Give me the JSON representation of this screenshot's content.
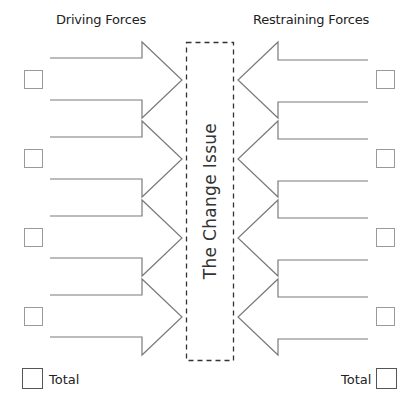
{
  "diagram": {
    "type": "force-field-analysis",
    "driving_title": "Driving Forces",
    "restraining_title": "Restraining Forces",
    "center_label": "The Change Issue",
    "total_label_left": "Total",
    "total_label_right": "Total",
    "driving_forces": [
      {
        "score": ""
      },
      {
        "score": ""
      },
      {
        "score": ""
      },
      {
        "score": ""
      }
    ],
    "restraining_forces": [
      {
        "score": ""
      },
      {
        "score": ""
      },
      {
        "score": ""
      },
      {
        "score": ""
      }
    ],
    "driving_total": "",
    "restraining_total": "",
    "colors": {
      "arrow_stroke": "#7a7a7a",
      "box_stroke": "#9a9a9a",
      "dashed_border": "#333333",
      "text": "#222222"
    }
  }
}
